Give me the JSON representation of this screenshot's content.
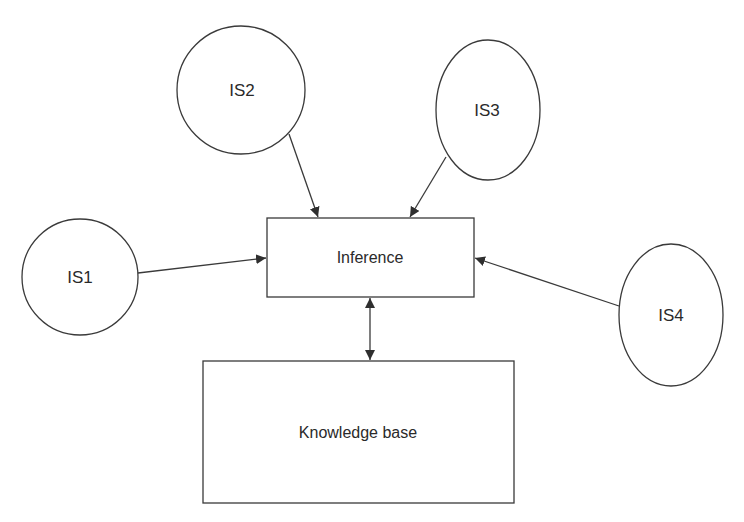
{
  "diagram": {
    "colors": {
      "stroke": "#3a3a3a",
      "text": "#2a2a2a",
      "background": "#ffffff"
    },
    "nodes": {
      "is1": {
        "label": "IS1",
        "shape": "circle"
      },
      "is2": {
        "label": "IS2",
        "shape": "circle"
      },
      "is3": {
        "label": "IS3",
        "shape": "ellipse"
      },
      "is4": {
        "label": "IS4",
        "shape": "ellipse"
      },
      "inference": {
        "label": "Inference",
        "shape": "rectangle"
      },
      "knowledge_base": {
        "label": "Knowledge base",
        "shape": "rectangle"
      }
    },
    "edges": [
      {
        "from": "IS1",
        "to": "Inference",
        "direction": "forward"
      },
      {
        "from": "IS2",
        "to": "Inference",
        "direction": "forward"
      },
      {
        "from": "IS3",
        "to": "Inference",
        "direction": "forward"
      },
      {
        "from": "IS4",
        "to": "Inference",
        "direction": "forward"
      },
      {
        "from": "Inference",
        "to": "Knowledge base",
        "direction": "bidirectional"
      }
    ]
  }
}
